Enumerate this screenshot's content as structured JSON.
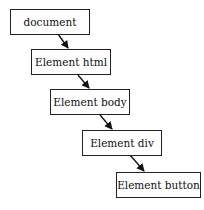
{
  "diagram": {
    "type": "dom-hierarchy",
    "nodes": [
      {
        "id": "document",
        "label": "document"
      },
      {
        "id": "html",
        "label": "Element html"
      },
      {
        "id": "body",
        "label": "Element body"
      },
      {
        "id": "div",
        "label": "Element div"
      },
      {
        "id": "button",
        "label": "Element button"
      }
    ],
    "edges": [
      {
        "from": "document",
        "to": "html"
      },
      {
        "from": "html",
        "to": "body"
      },
      {
        "from": "body",
        "to": "div"
      },
      {
        "from": "div",
        "to": "button"
      }
    ],
    "colors": {
      "stroke": "#222222",
      "background": "#ffffff"
    }
  }
}
